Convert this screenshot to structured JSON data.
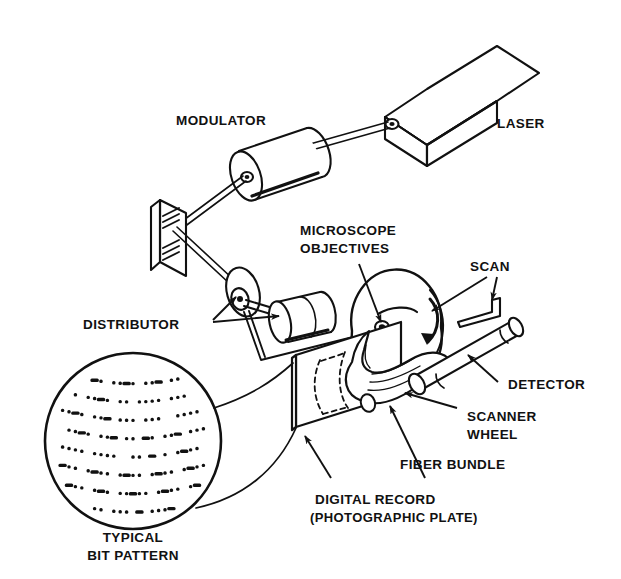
{
  "figure": {
    "background_color": "#ffffff",
    "ink_color": "#111111"
  },
  "labels": {
    "laser": "LASER",
    "modulator": "MODULATOR",
    "microscope_objectives_line1": "MICROSCOPE",
    "microscope_objectives_line2": "OBJECTIVES",
    "scan": "SCAN",
    "distributor": "DISTRIBUTOR",
    "detector": "DETECTOR",
    "scanner_wheel_line1": "SCANNER",
    "scanner_wheel_line2": "WHEEL",
    "fiber_bundle": "FIBER BUNDLE",
    "digital_record_line1": "DIGITAL RECORD",
    "digital_record_line2": "(PHOTOGRAPHIC PLATE)",
    "typical_bit_pattern_line1": "TYPICAL",
    "typical_bit_pattern_line2": "BIT PATTERN"
  },
  "components": [
    {
      "name": "laser",
      "shape": "isometric-box"
    },
    {
      "name": "modulator",
      "shape": "cylinder"
    },
    {
      "name": "mirror",
      "shape": "hatched-plate"
    },
    {
      "name": "distributor",
      "shape": "disc-with-hub"
    },
    {
      "name": "microscope-objectives",
      "shape": "cylinder"
    },
    {
      "name": "scanner-wheel",
      "shape": "disc-with-lenslets"
    },
    {
      "name": "photographic-plate",
      "shape": "parallelogram"
    },
    {
      "name": "fiber-bundle",
      "shape": "curved-horn"
    },
    {
      "name": "detector",
      "shape": "tube"
    },
    {
      "name": "bit-pattern-magnifier",
      "shape": "circle"
    }
  ],
  "bit_pattern": {
    "rows": 8,
    "description": "curved rows of dots and dashes",
    "row_dots": [
      [
        1,
        1,
        1,
        0,
        0,
        1,
        1,
        0,
        1,
        1,
        1,
        1,
        0,
        1,
        1,
        1,
        0,
        1,
        1,
        1,
        0,
        0,
        1
      ],
      [
        1,
        1,
        1,
        0,
        1,
        1,
        1,
        1,
        0,
        1,
        1,
        0,
        1,
        1,
        1,
        1,
        0,
        1,
        1,
        1,
        0,
        1,
        1
      ],
      [
        1,
        1,
        1,
        1,
        0,
        1,
        1,
        1,
        0,
        1,
        1,
        1,
        0,
        1,
        1,
        1,
        0,
        0,
        1,
        1,
        1,
        1,
        0
      ],
      [
        0,
        1,
        1,
        1,
        1,
        0,
        1,
        1,
        1,
        0,
        1,
        1,
        0,
        1,
        1,
        0,
        1,
        1,
        1,
        0,
        1,
        1,
        1
      ],
      [
        1,
        1,
        1,
        1,
        0,
        1,
        1,
        1,
        1,
        0,
        0,
        1,
        1,
        0,
        1,
        0,
        1,
        0,
        1,
        1,
        1,
        1,
        0
      ],
      [
        1,
        1,
        1,
        0,
        1,
        1,
        1,
        1,
        0,
        1,
        1,
        1,
        1,
        0,
        1,
        1,
        1,
        1,
        0,
        1,
        1,
        1,
        1
      ],
      [
        1,
        1,
        1,
        1,
        0,
        1,
        1,
        1,
        0,
        1,
        1,
        1,
        1,
        1,
        0,
        1,
        1,
        1,
        1,
        0,
        1,
        1,
        1
      ],
      [
        1,
        1,
        1,
        0,
        1,
        1,
        1,
        0,
        1,
        1,
        1,
        0,
        1,
        0,
        1,
        1,
        1,
        1,
        1,
        0,
        1,
        1,
        0
      ]
    ]
  }
}
